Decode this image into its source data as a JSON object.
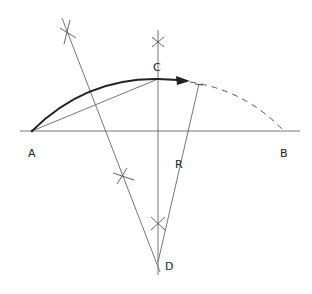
{
  "diagram": {
    "labels": {
      "A": "A",
      "B": "B",
      "C": "C",
      "D": "D",
      "R": "R"
    },
    "points": {
      "A": [
        32,
        131
      ],
      "B": [
        284,
        131
      ],
      "C": [
        158,
        77
      ],
      "D": [
        158,
        262
      ]
    },
    "colors": {
      "line": "#555555",
      "arc": "#222222",
      "background": "#ffffff"
    }
  }
}
